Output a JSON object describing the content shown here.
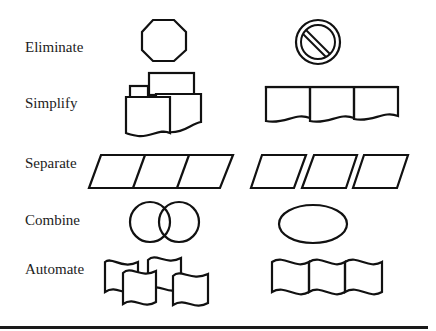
{
  "diagram": {
    "type": "process-improvement-principles",
    "stroke_color": "#111111",
    "background": "#ffffff",
    "rows": [
      {
        "label": "Eliminate",
        "before": "octagon (stop sign)",
        "after": "prohibition circle symbol"
      },
      {
        "label": "Simplify",
        "before": "cluster of overlapping documents and boxes",
        "after": "three connected document shapes in a row"
      },
      {
        "label": "Separate",
        "before": "three joined parallelograms",
        "after": "three separate parallelograms"
      },
      {
        "label": "Combine",
        "before": "two overlapping circles",
        "after": "single ellipse"
      },
      {
        "label": "Automate",
        "before": "scattered overlapping wavy tape shapes",
        "after": "three connected wavy tape shapes in a row"
      }
    ]
  }
}
